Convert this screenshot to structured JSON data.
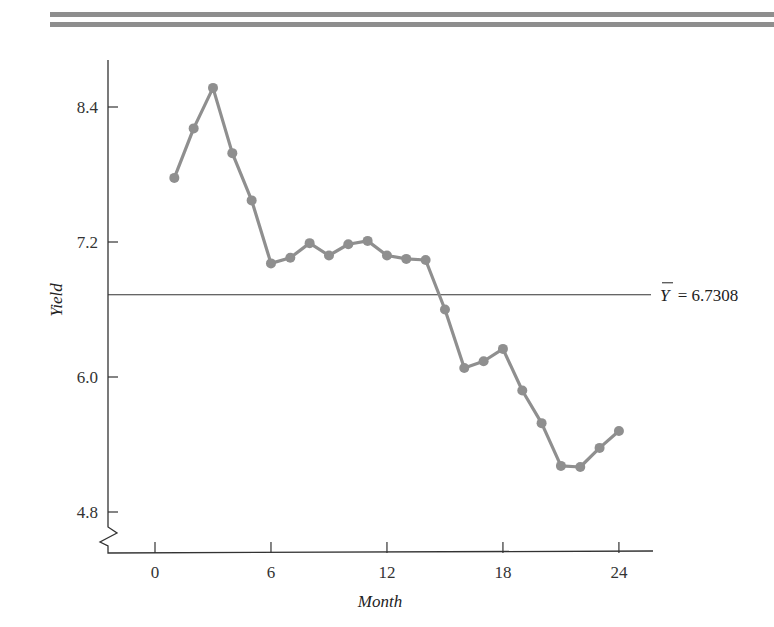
{
  "chart_data": {
    "type": "line",
    "title": "",
    "xlabel": "Month",
    "ylabel": "Yield",
    "x": [
      1,
      2,
      3,
      4,
      5,
      6,
      7,
      8,
      9,
      10,
      11,
      12,
      13,
      14,
      15,
      16,
      17,
      18,
      19,
      20,
      21,
      22,
      23,
      24
    ],
    "series": [
      {
        "name": "Yield",
        "values": [
          7.77,
          8.21,
          8.57,
          7.99,
          7.57,
          7.01,
          7.06,
          7.19,
          7.08,
          7.18,
          7.21,
          7.08,
          7.05,
          7.04,
          6.6,
          6.08,
          6.14,
          6.25,
          5.88,
          5.59,
          5.21,
          5.2,
          5.37,
          5.52
        ]
      }
    ],
    "x_ticks": [
      0,
      6,
      12,
      18,
      24
    ],
    "x_tick_labels": [
      "0",
      "6",
      "12",
      "18",
      "24"
    ],
    "y_ticks": [
      4.8,
      6.0,
      7.2,
      8.4
    ],
    "y_tick_labels": [
      "4.8",
      "6.0",
      "7.2",
      "8.4"
    ],
    "xlim": [
      -2.5,
      25.5
    ],
    "ylim": [
      4.6,
      8.8
    ],
    "y_axis_break": true,
    "grid": false,
    "legend": null,
    "reference_line": {
      "y": 6.7308,
      "label": "Y̅ = 6.7308",
      "label_symbol": "Y",
      "label_value": "= 6.7308"
    },
    "series_color": "#8f8f8f",
    "axis_color": "#333333"
  }
}
